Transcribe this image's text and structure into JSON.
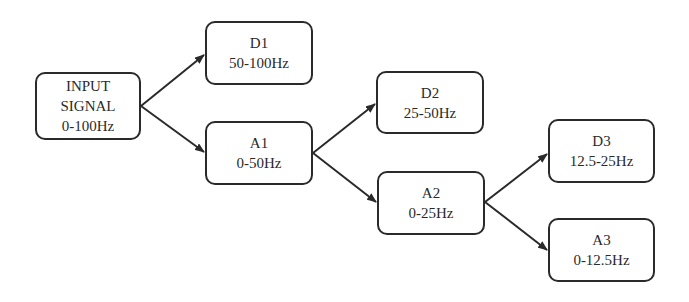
{
  "diagram": {
    "title": "",
    "colors": {
      "stroke": "#2a2a2a",
      "background": "#ffffff",
      "text": "#2a2a2a"
    },
    "nodes": {
      "input": {
        "lines": [
          "INPUT",
          "SIGNAL",
          "0-100Hz"
        ],
        "x": 35,
        "y": 72,
        "w": 106,
        "h": 68
      },
      "d1": {
        "lines": [
          "D1",
          "50-100Hz"
        ],
        "x": 205,
        "y": 21,
        "w": 108,
        "h": 64
      },
      "a1": {
        "lines": [
          "A1",
          "0-50Hz"
        ],
        "x": 205,
        "y": 121,
        "w": 108,
        "h": 64
      },
      "d2": {
        "lines": [
          "D2",
          "25-50Hz"
        ],
        "x": 376,
        "y": 71,
        "w": 108,
        "h": 63
      },
      "a2": {
        "lines": [
          "A2",
          "0-25Hz"
        ],
        "x": 377,
        "y": 171,
        "w": 108,
        "h": 64
      },
      "d3": {
        "lines": [
          "D3",
          "12.5-25Hz"
        ],
        "x": 548,
        "y": 119,
        "w": 107,
        "h": 64
      },
      "a3": {
        "lines": [
          "A3",
          "0-12.5Hz"
        ],
        "x": 548,
        "y": 218,
        "w": 107,
        "h": 64
      }
    },
    "edges": [
      {
        "from": "input",
        "to": "d1"
      },
      {
        "from": "input",
        "to": "a1"
      },
      {
        "from": "a1",
        "to": "d2"
      },
      {
        "from": "a1",
        "to": "a2"
      },
      {
        "from": "a2",
        "to": "d3"
      },
      {
        "from": "a2",
        "to": "a3"
      }
    ]
  }
}
